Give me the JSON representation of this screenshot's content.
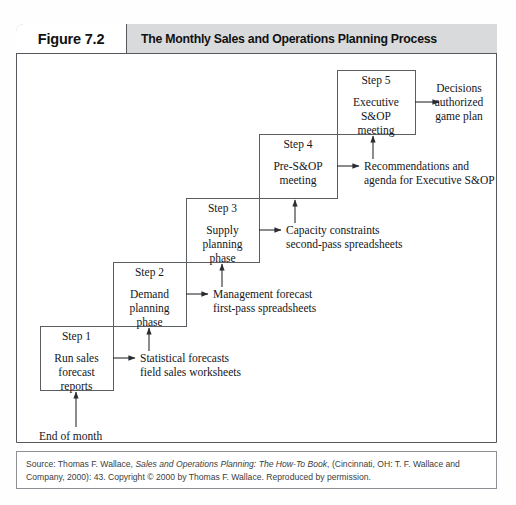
{
  "figure": {
    "label": "Figure 7.2",
    "title": "The Monthly Sales and Operations Planning Process"
  },
  "diagram": {
    "type": "staircase-process-flow",
    "entry_label": "End of month",
    "steps": [
      {
        "step_label": "Step 1",
        "body": "Run sales\nforecast\nreports",
        "body_lines": [
          "Run sales",
          "forecast",
          "reports"
        ],
        "output": "Statistical forecasts\nfield sales worksheets",
        "output_lines": [
          "Statistical forecasts",
          "field sales worksheets"
        ]
      },
      {
        "step_label": "Step 2",
        "body": "Demand\nplanning\nphase",
        "body_lines": [
          "Demand",
          "planning",
          "phase"
        ],
        "output": "Management forecast\nfirst-pass spreadsheets",
        "output_lines": [
          "Management forecast",
          "first-pass spreadsheets"
        ]
      },
      {
        "step_label": "Step 3",
        "body": "Supply\nplanning\nphase",
        "body_lines": [
          "Supply",
          "planning",
          "phase"
        ],
        "output": "Capacity constraints\nsecond-pass spreadsheets",
        "output_lines": [
          "Capacity constraints",
          "second-pass spreadsheets"
        ]
      },
      {
        "step_label": "Step 4",
        "body": "Pre-S&OP\nmeeting",
        "body_lines": [
          "Pre-S&OP",
          "meeting"
        ],
        "output": "Recommendations and\nagenda for Executive S&OP",
        "output_lines": [
          "Recommendations and",
          "agenda for Executive S&OP"
        ]
      },
      {
        "step_label": "Step 5",
        "body": "Executive\nS&OP\nmeeting",
        "body_lines": [
          "Executive",
          "S&OP",
          "meeting"
        ],
        "output": "Decisions\nauthorized\ngame plan",
        "output_lines": [
          "Decisions",
          "authorized",
          "game plan"
        ]
      }
    ]
  },
  "source": {
    "prefix": "Source: Thomas F. Wallace, ",
    "italic_title": "Sales and Operations Planning: The How-To Book",
    "suffix": ", (Cincinnati, OH: T. F. Wallace and Company, 2000): 43. Copyright © 2000 by Thomas F. Wallace. Reproduced by permission."
  },
  "colors": {
    "header_band": "#d9dadc",
    "frame_stroke": "#55585c",
    "box_stroke": "#5a5d61",
    "text": "#15161a",
    "page_background": "#ffffff"
  }
}
